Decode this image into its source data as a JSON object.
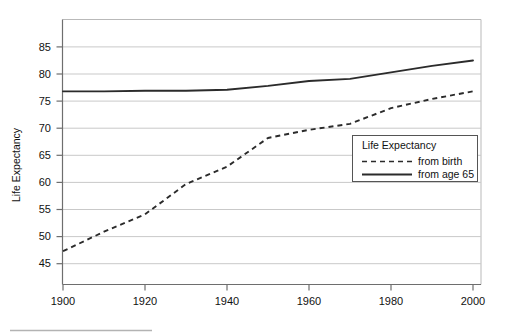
{
  "chart_data": {
    "type": "line",
    "title": "",
    "xlabel": "",
    "ylabel": "Life Expectancy",
    "xlim": [
      1900,
      2000
    ],
    "ylim": [
      42.5,
      88
    ],
    "xticks": [
      "1900",
      "1920",
      "1940",
      "1960",
      "1980",
      "2000"
    ],
    "yticks": [
      "45",
      "50",
      "55",
      "60",
      "65",
      "70",
      "75",
      "80",
      "85"
    ],
    "grid": true,
    "legend_position": "lower-right",
    "legend_title": "Life Expectancy",
    "x": [
      1900,
      1910,
      1920,
      1930,
      1940,
      1950,
      1960,
      1970,
      1980,
      1990,
      2000
    ],
    "series": [
      {
        "name": "from birth",
        "style": "dashed",
        "color": "#2b2b2b",
        "values": [
          47.3,
          50.9,
          54.1,
          59.7,
          62.9,
          68.2,
          69.7,
          70.8,
          73.7,
          75.4,
          76.8
        ]
      },
      {
        "name": "from age 65",
        "style": "solid",
        "color": "#2b2b2b",
        "values": [
          76.8,
          76.8,
          76.9,
          76.9,
          77.1,
          77.8,
          78.7,
          79.1,
          80.3,
          81.5,
          82.5
        ]
      }
    ]
  },
  "legend": {
    "title": "Life Expectancy",
    "entries": [
      {
        "label": "from birth",
        "style": "dashed"
      },
      {
        "label": "from age 65",
        "style": "solid"
      }
    ]
  },
  "axes": {
    "y_title": "Life Expectancy"
  }
}
